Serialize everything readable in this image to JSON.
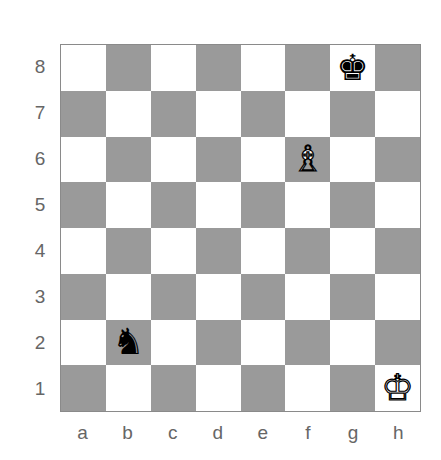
{
  "board": {
    "files": [
      "a",
      "b",
      "c",
      "d",
      "e",
      "f",
      "g",
      "h"
    ],
    "ranks": [
      "8",
      "7",
      "6",
      "5",
      "4",
      "3",
      "2",
      "1"
    ],
    "colors": {
      "light": "#ffffff",
      "dark": "#9a9a9a"
    },
    "pieces": [
      {
        "square": "g8",
        "piece": "king",
        "color": "black",
        "glyph": "♚",
        "icon": "black-king-icon"
      },
      {
        "square": "f6",
        "piece": "bishop",
        "color": "white",
        "glyph": "♗",
        "icon": "white-bishop-icon"
      },
      {
        "square": "b2",
        "piece": "knight",
        "color": "black",
        "glyph": "♞",
        "icon": "black-knight-icon"
      },
      {
        "square": "h1",
        "piece": "king",
        "color": "white",
        "glyph": "♔",
        "icon": "white-king-icon"
      }
    ]
  }
}
